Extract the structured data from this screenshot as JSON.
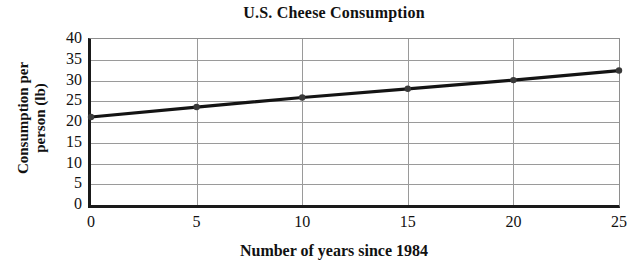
{
  "chart_data": {
    "type": "line",
    "title": "U.S. Cheese Consumption",
    "xlabel": "Number of years since 1984",
    "ylabel_line1": "Consumption per",
    "ylabel_line2": "person (lb)",
    "ylabel": "Consumption per person (lb)",
    "x": [
      0,
      5,
      10,
      15,
      20,
      25
    ],
    "values": [
      21.2,
      23.6,
      25.9,
      28.0,
      30.1,
      32.4
    ],
    "series": [
      {
        "name": "Consumption per person (lb)",
        "values": [
          21.2,
          23.6,
          25.9,
          28.0,
          30.1,
          32.4
        ]
      }
    ],
    "xlim": [
      0,
      25
    ],
    "ylim": [
      0,
      40
    ],
    "xticks": [
      "0",
      "5",
      "10",
      "15",
      "20",
      "25"
    ],
    "yticks": [
      "0",
      "5",
      "10",
      "15",
      "20",
      "25",
      "30",
      "35",
      "40"
    ],
    "xtick_values": [
      0,
      5,
      10,
      15,
      20,
      25
    ],
    "ytick_values": [
      0,
      5,
      10,
      15,
      20,
      25,
      30,
      35,
      40
    ],
    "grid": "horizontal and vertical",
    "legend": "none",
    "line_color": "#141414",
    "marker_color": "#3a3a3a",
    "grid_color": "#9a9a9a",
    "axis_color": "#1a1a1a",
    "background_color": "#ffffff"
  }
}
